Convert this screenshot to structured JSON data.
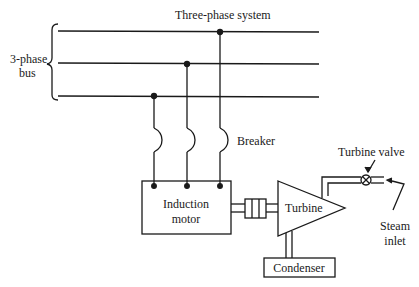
{
  "diagram": {
    "title": "Three-phase system",
    "bus_label_line1": "3-phase",
    "bus_label_line2": "bus",
    "breaker_label": "Breaker",
    "motor_label_line1": "Induction",
    "motor_label_line2": "motor",
    "turbine_label": "Turbine",
    "condenser_label": "Condenser",
    "valve_label": "Turbine valve",
    "steam_label_line1": "Steam",
    "steam_label_line2": "inlet",
    "colors": {
      "line": "#1a1a1a",
      "background": "#ffffff"
    }
  }
}
